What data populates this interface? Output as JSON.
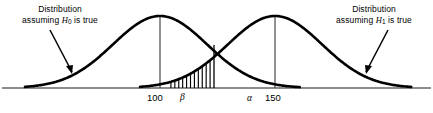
{
  "figure": {
    "annotations": {
      "left": {
        "line1": "Distribution",
        "line2_prefix": "assuming ",
        "symbol": "H",
        "subscript": "0",
        "line2_suffix": " is true"
      },
      "right": {
        "line1": "Distribution",
        "line2_prefix": "assuming ",
        "symbol": "H",
        "subscript": "1",
        "line2_suffix": " is true"
      }
    },
    "axis_labels": {
      "mean_null": "100",
      "mean_alt": "150",
      "beta": "β",
      "alpha": "α"
    },
    "colors": {
      "curve": "#000000",
      "axis": "#555555",
      "hatch": "#000000",
      "background": "#ffffff",
      "text": "#000000"
    }
  },
  "chart_data": {
    "type": "line",
    "title": "",
    "xlabel": "",
    "ylabel": "",
    "xlim": [
      0,
      433
    ],
    "ylim": [
      0,
      113
    ],
    "grid": false,
    "legend": "none",
    "baseline_y": 88,
    "series": [
      {
        "name": "Distribution assuming H0 is true",
        "mean_label": "100",
        "mean_x": 160,
        "peak_y": 16,
        "sigma_px": 47,
        "start_x": 25,
        "end_x": 300
      },
      {
        "name": "Distribution assuming H1 is true",
        "mean_label": "150",
        "mean_x": 275,
        "peak_y": 16,
        "sigma_px": 47,
        "start_x": 140,
        "end_x": 412
      }
    ],
    "regions": [
      {
        "name": "beta",
        "label": "β",
        "description": "Type II error region: area under H1 curve left of critical value",
        "x_from": 167,
        "x_to": 214,
        "hatch_lines": 11,
        "hatch_orientation": "vertical"
      },
      {
        "name": "alpha",
        "label": "α",
        "description": "Type I error region: area under H0 curve right of critical value",
        "x_from": 214,
        "x_to": 300,
        "hatch_lines": 0,
        "hatch_orientation": "none"
      }
    ],
    "crossing_point": {
      "x": 213,
      "y": 45
    },
    "vertical_lines": [
      {
        "at_x": 160,
        "from_y": 88,
        "to_y": 17,
        "label": "100"
      },
      {
        "at_x": 275,
        "from_y": 88,
        "to_y": 17,
        "label": "150"
      },
      {
        "at_x": 214,
        "from_y": 88,
        "to_y": 45,
        "label": "critical value"
      }
    ],
    "pointer_arrows": [
      {
        "name": "left-pointer",
        "from_x": 50,
        "from_y": 30,
        "to_x": 72,
        "to_y": 72
      },
      {
        "name": "right-pointer",
        "from_x": 388,
        "from_y": 30,
        "to_x": 366,
        "to_y": 72
      }
    ]
  }
}
